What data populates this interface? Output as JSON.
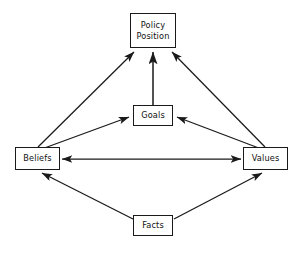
{
  "diagram": {
    "background_color": "#ffffff",
    "line_color": "#1a1a1a",
    "text_color": "#111111",
    "nodes": [
      {
        "id": "policy-position",
        "label": "Policy Position",
        "label_line1": "Policy",
        "label_line2": "Position",
        "x": 130,
        "y": 13,
        "w": 46,
        "h": 35
      },
      {
        "id": "goals",
        "label": "Goals",
        "label_line1": "Goals",
        "label_line2": "",
        "x": 133,
        "y": 105,
        "w": 40,
        "h": 21
      },
      {
        "id": "beliefs",
        "label": "Beliefs",
        "label_line1": "Beliefs",
        "label_line2": "",
        "x": 15,
        "y": 147,
        "w": 45,
        "h": 23
      },
      {
        "id": "values",
        "label": "Values",
        "label_line1": "Values",
        "label_line2": "",
        "x": 243,
        "y": 147,
        "w": 45,
        "h": 23
      },
      {
        "id": "facts",
        "label": "Facts",
        "label_line1": "Facts",
        "label_line2": "",
        "x": 133,
        "y": 215,
        "w": 40,
        "h": 21
      }
    ],
    "edges": [
      {
        "id": "beliefs-to-policy",
        "from": "beliefs",
        "to": "policy-position",
        "arrows": "to"
      },
      {
        "id": "goals-to-policy",
        "from": "goals",
        "to": "policy-position",
        "arrows": "to"
      },
      {
        "id": "values-to-policy",
        "from": "values",
        "to": "policy-position",
        "arrows": "to"
      },
      {
        "id": "beliefs-to-goals",
        "from": "beliefs",
        "to": "goals",
        "arrows": "to"
      },
      {
        "id": "values-to-goals",
        "from": "values",
        "to": "goals",
        "arrows": "to"
      },
      {
        "id": "beliefs-values",
        "from": "beliefs",
        "to": "values",
        "arrows": "both"
      },
      {
        "id": "facts-to-beliefs",
        "from": "facts",
        "to": "beliefs",
        "arrows": "to"
      },
      {
        "id": "facts-to-values",
        "from": "facts",
        "to": "values",
        "arrows": "to"
      }
    ]
  }
}
